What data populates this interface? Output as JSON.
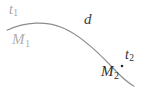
{
  "figure": {
    "type": "trajectory-arc-diagram",
    "background_color": "#ffffff",
    "width": 143,
    "height": 89
  },
  "curve": {
    "name": "trajectory-arc",
    "stroke_color": "#8c8c8c",
    "stroke_width": 1.1,
    "start_point": {
      "x": 7,
      "y": 30
    },
    "apex_point": {
      "x": 56,
      "y": 23
    },
    "end_point": {
      "x": 134,
      "y": 86
    }
  },
  "marker": {
    "name": "position-dot",
    "color": "#2b2b2b",
    "x": 122,
    "y": 66,
    "radius": 1.3
  },
  "labels": {
    "start_time": {
      "text": "t",
      "subscript": "1",
      "color": "#a6a6a6"
    },
    "start_mass": {
      "text": "M",
      "subscript": "1",
      "color": "#b0b0b0"
    },
    "distance": {
      "text": "d",
      "color": "#3b3b3b"
    },
    "end_time": {
      "text": "t",
      "subscript": "2",
      "color": "#2e2e2e"
    },
    "end_mass": {
      "text": "M",
      "subscript": "2",
      "color": "#2b2b2b"
    }
  }
}
